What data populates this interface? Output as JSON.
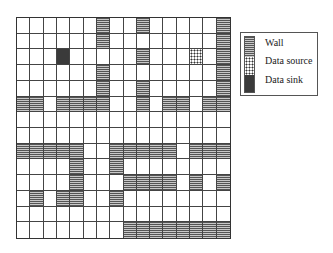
{
  "grid": {
    "columns": 16,
    "rows": 14,
    "legend_key": {
      ".": "empty",
      "W": "wall",
      "S": "source",
      "K": "sink"
    },
    "cells": [
      "......W..W.....W",
      "......W........W",
      "...K.....W...S.W",
      "......W........W",
      "......W..W.....W",
      "WW.WWWW..W.WW.WW",
      "................",
      "................",
      "WWWWW..WWWWW.WWW",
      "....W..W........",
      "....W...WWWW.W.W",
      ".W.WW..W........",
      "................",
      "........WWWWWWWW"
    ]
  },
  "legend": {
    "items": [
      {
        "label": "Wall",
        "type": "wall"
      },
      {
        "label": "Data source",
        "type": "source"
      },
      {
        "label": "Data sink",
        "type": "sink"
      }
    ]
  },
  "colors": {
    "grid_line": "#444444",
    "wall_stripe": "#555555",
    "sink": "#3a3a3a",
    "source_dot": "#333333"
  }
}
